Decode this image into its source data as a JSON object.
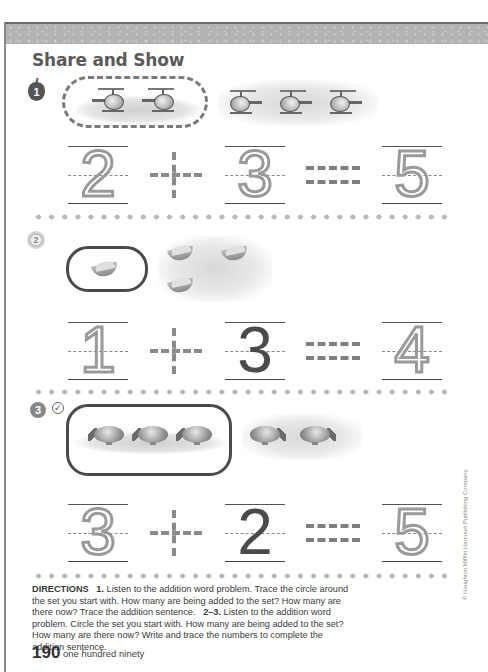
{
  "header": {
    "title": "Share and Show"
  },
  "problems": [
    {
      "number_label": "1",
      "badge_icon": "apple-icon",
      "start_set": {
        "object": "helicopter",
        "count": 2,
        "circle_style": "dashed-trace"
      },
      "added_set": {
        "object": "helicopter",
        "count": 3
      },
      "sentence": {
        "addend1": "2",
        "operator": "+",
        "addend2": "3",
        "equals": "=",
        "sum": "5"
      },
      "styles": {
        "addend1": "trace",
        "addend2": "trace",
        "sum": "trace"
      }
    },
    {
      "number_label": "2",
      "badge_icon": "sun-icon",
      "start_set": {
        "object": "melon-slice",
        "count": 1,
        "circle_style": "solid"
      },
      "added_set": {
        "object": "melon-slice",
        "count": 3
      },
      "sentence": {
        "addend1": "1",
        "operator": "+",
        "addend2": "3",
        "equals": "=",
        "sum": "4"
      },
      "styles": {
        "addend1": "trace",
        "addend2": "solid",
        "sum": "trace"
      }
    },
    {
      "number_label": "3",
      "badge_icon": "gear-icon",
      "check_icon": "check-circle-icon",
      "start_set": {
        "object": "blimp",
        "count": 3,
        "circle_style": "solid"
      },
      "added_set": {
        "object": "blimp",
        "count": 2
      },
      "sentence": {
        "addend1": "3",
        "operator": "+",
        "addend2": "2",
        "equals": "=",
        "sum": "5"
      },
      "styles": {
        "addend1": "trace",
        "addend2": "solid",
        "sum": "trace"
      }
    }
  ],
  "directions": {
    "heading": "DIRECTIONS",
    "part1_label": "1.",
    "part1_text": "Listen to the addition word problem. Trace the circle around the set you start with. How many are being added to the set? How many are there now? Trace the addition sentence.",
    "part2_label": "2–3.",
    "part2_text": "Listen to the addition word problem. Circle the set you start with. How many are being added to the set? How many are there now? Write and trace the numbers to complete the addition sentence."
  },
  "footer": {
    "page_number": "190",
    "page_words": "one hundred ninety",
    "copyright": "© Houghton Mifflin Harcourt Publishing Company"
  },
  "colors": {
    "band": "#b3b3b3",
    "title": "#5a5a5a",
    "trace": "#9a9a9a",
    "solid_digit": "#4a4a4a",
    "dots": "#b8b8b8"
  }
}
